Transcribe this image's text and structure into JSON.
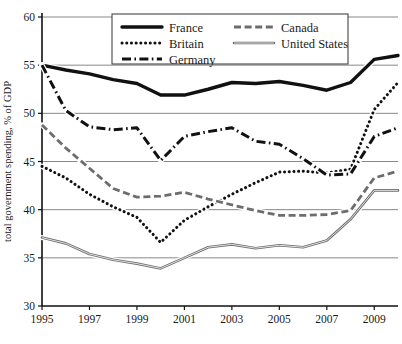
{
  "chart_data": {
    "type": "line",
    "title": "",
    "xlabel": "",
    "ylabel": "total government spending, % of GDP",
    "xlim": [
      1995,
      2010
    ],
    "ylim": [
      30,
      60
    ],
    "yticks": [
      30,
      35,
      40,
      45,
      50,
      55,
      60
    ],
    "xticks": [
      1995,
      1997,
      1999,
      2001,
      2003,
      2005,
      2007,
      2009
    ],
    "xtick_labels": [
      "1995",
      "1997",
      "1999",
      "2001",
      "2003",
      "2005",
      "2007",
      "2009"
    ],
    "ytick_labels": [
      "30",
      "35",
      "40",
      "45",
      "50",
      "55",
      "60"
    ],
    "grid": "horizontal",
    "legend_position": "top-center",
    "x": [
      1995,
      1996,
      1997,
      1998,
      1999,
      2000,
      2001,
      2002,
      2003,
      2004,
      2005,
      2006,
      2007,
      2008,
      2009,
      2010
    ],
    "series": [
      {
        "name": "France",
        "style": "solid-thick",
        "color": "#111111",
        "values": [
          55.0,
          54.5,
          54.1,
          53.5,
          53.1,
          51.9,
          51.9,
          52.5,
          53.2,
          53.1,
          53.3,
          52.9,
          52.4,
          53.2,
          55.6,
          56.0
        ]
      },
      {
        "name": "Britain",
        "style": "dotted",
        "color": "#111111",
        "values": [
          44.5,
          43.3,
          41.6,
          40.3,
          39.2,
          36.6,
          38.9,
          40.3,
          41.6,
          42.8,
          43.9,
          44.0,
          43.8,
          44.2,
          50.4,
          53.2
        ]
      },
      {
        "name": "Germany",
        "style": "dash-dot",
        "color": "#111111",
        "values": [
          55.0,
          50.3,
          48.6,
          48.3,
          48.5,
          45.1,
          47.6,
          48.1,
          48.5,
          47.1,
          46.8,
          45.3,
          43.6,
          43.7,
          47.6,
          48.5
        ]
      },
      {
        "name": "Canada",
        "style": "dashed",
        "color": "#6d6d6d",
        "values": [
          48.8,
          46.4,
          44.3,
          42.2,
          41.3,
          41.4,
          41.8,
          41.1,
          40.5,
          39.9,
          39.4,
          39.4,
          39.5,
          39.9,
          43.3,
          44.0
        ]
      },
      {
        "name": "United States",
        "style": "solid-double",
        "color": "#6d6d6d",
        "values": [
          37.1,
          36.5,
          35.4,
          34.8,
          34.4,
          33.9,
          35.0,
          36.1,
          36.4,
          36.0,
          36.3,
          36.1,
          36.8,
          39.0,
          42.0,
          42.0
        ]
      }
    ]
  },
  "legend": {
    "items": [
      {
        "label": "France",
        "key": "france"
      },
      {
        "label": "Canada",
        "key": "canada"
      },
      {
        "label": "Britain",
        "key": "britain"
      },
      {
        "label": "United States",
        "key": "united-states"
      },
      {
        "label": "Germany",
        "key": "germany"
      }
    ]
  }
}
